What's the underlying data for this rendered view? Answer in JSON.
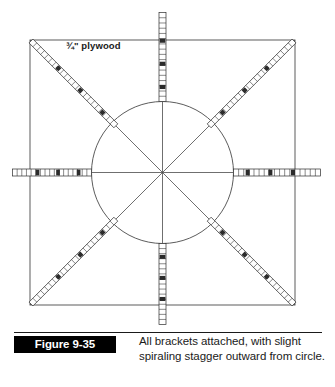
{
  "figure": {
    "badge_label": "Figure 9-35",
    "caption": "All brackets attached, with slight spiraling stagger outward from circle.",
    "plywood_label": "¾\" plywood"
  },
  "colors": {
    "ink": "#1a1a1a",
    "line": "#4a4a4a",
    "bracket_fill": "#ffffff",
    "bracket_stroke": "#2b2b2b",
    "badge_bg": "#000000",
    "badge_text": "#ffffff",
    "page_bg": "#ffffff"
  },
  "geometry": {
    "square": {
      "x": 30,
      "y": 40,
      "size": 265
    },
    "circle": {
      "cx": 162.5,
      "cy": 172.5,
      "r": 71
    },
    "diagonals": "corner-to-corner both directions",
    "axes": "horizontal and vertical through center"
  },
  "chart_data": {
    "type": "diagram",
    "title": "All brackets attached, with slight spiraling stagger outward from circle.",
    "shapes": [
      "square",
      "circle",
      "two diagonals",
      "horizontal axis",
      "vertical axis"
    ],
    "bracket_count": 8,
    "brackets": [
      {
        "name": "bracket-north",
        "angle_deg": 270,
        "inner_r": 71,
        "outer_r": 160,
        "width": 7,
        "rungs": 17
      },
      {
        "name": "bracket-northeast",
        "angle_deg": 315,
        "inner_r": 66,
        "outer_r": 186,
        "width": 5.5,
        "rungs": 22
      },
      {
        "name": "bracket-east",
        "angle_deg": 0,
        "inner_r": 71,
        "outer_r": 158,
        "width": 7,
        "rungs": 17
      },
      {
        "name": "bracket-southeast",
        "angle_deg": 45,
        "inner_r": 66,
        "outer_r": 186,
        "width": 5.5,
        "rungs": 22
      },
      {
        "name": "bracket-south",
        "angle_deg": 90,
        "inner_r": 71,
        "outer_r": 152,
        "width": 7,
        "rungs": 16
      },
      {
        "name": "bracket-southwest",
        "angle_deg": 135,
        "inner_r": 66,
        "outer_r": 186,
        "width": 5.5,
        "rungs": 22
      },
      {
        "name": "bracket-west",
        "angle_deg": 180,
        "inner_r": 71,
        "outer_r": 150,
        "width": 7,
        "rungs": 17
      },
      {
        "name": "bracket-northwest",
        "angle_deg": 225,
        "inner_r": 66,
        "outer_r": 186,
        "width": 5.5,
        "rungs": 22
      }
    ],
    "annotations": [
      {
        "text": "¾\" plywood",
        "x": 66,
        "y": 48
      }
    ]
  }
}
